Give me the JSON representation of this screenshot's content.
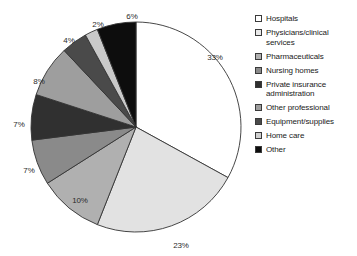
{
  "chart_data": {
    "type": "pie",
    "title": "",
    "legend_position": "right",
    "start_angle_deg": 0,
    "direction": "clockwise",
    "categories": [
      "Hospitals",
      "Physicians/clinical services",
      "Pharmaceuticals",
      "Nursing homes",
      "Private insurance administration",
      "Other professional",
      "Equipment/supplies",
      "Home care",
      "Other"
    ],
    "values": [
      33,
      23,
      10,
      7,
      7,
      8,
      4,
      2,
      6
    ],
    "value_labels": [
      "33%",
      "23%",
      "10%",
      "7%",
      "7%",
      "8%",
      "4%",
      "2%",
      "6%"
    ],
    "colors": [
      "#ffffff",
      "#e2e2e2",
      "#b0b0b0",
      "#8a8a8a",
      "#303030",
      "#9e9e9e",
      "#4a4a4a",
      "#c9c9c9",
      "#0d0d0d"
    ],
    "slice_border_color": "#333333",
    "label_positions": [
      {
        "label": "33%",
        "x": 215,
        "y": 57
      },
      {
        "label": "23%",
        "x": 181,
        "y": 245
      },
      {
        "label": "10%",
        "x": 80,
        "y": 200
      },
      {
        "label": "7%",
        "x": 29,
        "y": 170
      },
      {
        "label": "7%",
        "x": 19,
        "y": 124
      },
      {
        "label": "8%",
        "x": 39,
        "y": 81
      },
      {
        "label": "4%",
        "x": 69,
        "y": 40
      },
      {
        "label": "2%",
        "x": 98,
        "y": 24
      },
      {
        "label": "6%",
        "x": 132,
        "y": 16
      }
    ]
  },
  "legend": {
    "items": [
      {
        "label": "Hospitals",
        "color": "#ffffff"
      },
      {
        "label": "Physicians/clinical services",
        "color": "#e9e9e9"
      },
      {
        "label": "Pharmaceuticals",
        "color": "#b0b0b0"
      },
      {
        "label": "Nursing homes",
        "color": "#8a8a8a"
      },
      {
        "label": "Private insurance administration",
        "color": "#303030"
      },
      {
        "label": "Other professional",
        "color": "#9e9e9e"
      },
      {
        "label": "Equipment/supplies",
        "color": "#4a4a4a"
      },
      {
        "label": "Home care",
        "color": "#cfcfcf"
      },
      {
        "label": "Other",
        "color": "#0d0d0d"
      }
    ]
  }
}
